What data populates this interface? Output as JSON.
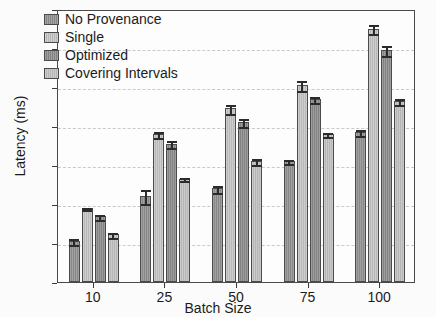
{
  "chart_data": {
    "type": "bar",
    "title": "",
    "xlabel": "Batch Size",
    "ylabel": "Latency (ms)",
    "categories": [
      "10",
      "25",
      "50",
      "75",
      "100"
    ],
    "ylim": [
      0,
      7
    ],
    "yticks": [
      0,
      1,
      2,
      3,
      4,
      5,
      6,
      7
    ],
    "ytick_labels": [
      "0",
      "1",
      "2",
      "3",
      "4",
      "5",
      "6",
      "7"
    ],
    "grid": true,
    "grid_axis": "y",
    "legend_position": "upper left",
    "series": [
      {
        "name": "No Provenance",
        "color": "#8f8f8f",
        "values": [
          1.05,
          2.2,
          2.4,
          3.1,
          3.85
        ],
        "errors": [
          0.1,
          0.2,
          0.12,
          0.07,
          0.1
        ]
      },
      {
        "name": "Single",
        "color": "#c3c3c3",
        "values": [
          1.9,
          3.8,
          4.45,
          5.05,
          6.5
        ],
        "errors": [
          0.05,
          0.1,
          0.15,
          0.15,
          0.15
        ]
      },
      {
        "name": "Optimized",
        "color": "#8a8a8a",
        "values": [
          1.68,
          3.55,
          4.1,
          4.7,
          5.95
        ],
        "errors": [
          0.08,
          0.12,
          0.12,
          0.1,
          0.15
        ]
      },
      {
        "name": "Covering Intervals",
        "color": "#c0c0c0",
        "values": [
          1.22,
          2.65,
          3.1,
          3.8,
          4.65
        ],
        "errors": [
          0.08,
          0.07,
          0.1,
          0.08,
          0.1
        ]
      }
    ]
  },
  "legend": {
    "items": [
      {
        "label": "No Provenance"
      },
      {
        "label": "Single"
      },
      {
        "label": "Optimized"
      },
      {
        "label": "Covering Intervals"
      }
    ]
  },
  "axes": {
    "y_title": "Latency (ms)",
    "x_title": "Batch Size"
  }
}
